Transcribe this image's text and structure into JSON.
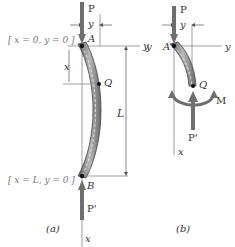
{
  "figure_a": {
    "caption": "(a)",
    "top_condition": "[ x = 0, y = 0 ]",
    "bottom_condition": "[ x = L, y = 0 ]",
    "load_top": "P",
    "load_bottom": "P'",
    "point_top": "A",
    "point_mid": "Q",
    "point_bottom": "B",
    "dim_x": "x",
    "dim_y": "y",
    "dim_L": "L",
    "axis_y": "y",
    "axis_x": "x"
  },
  "figure_b": {
    "caption": "(b)",
    "load_top": "P",
    "load_bottom": "P'",
    "point_top": "A",
    "point_mid": "Q",
    "moment": "M",
    "dim_y": "y",
    "axis_y_left": "y",
    "axis_y_right": "y",
    "axis_x": "x"
  },
  "colors": {
    "column_fill": "#8a8a8a",
    "arrow": "#6e6e6e",
    "line": "#555555",
    "text": "#333333",
    "condition_text": "#777777"
  }
}
